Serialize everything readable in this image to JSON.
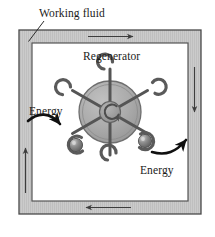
{
  "figure": {
    "title_labels": {
      "working_fluid": "Working fluid",
      "regenerator": "Regenerator",
      "energy_in": "Energy",
      "energy_out": "Energy"
    },
    "colors": {
      "duct_fill": "#c9c9c9",
      "duct_stripe": "#bdbdbd",
      "duct_border": "#4a4a4a",
      "chamber_fill": "#ffffff",
      "wheel_disc": "#a9a9a9",
      "wheel_disc_edge": "#6e6e6e",
      "spoke": "#5c5c5c",
      "hub": "#8f8f8f",
      "sphere": "#707070",
      "sphere_highlight": "#c4c4c4",
      "arrow_thin": "#3d3d3d",
      "arrow_thick": "#101010",
      "text": "#1a1a1a"
    },
    "duct": {
      "name": "working-fluid-duct",
      "outer": {
        "x": 19,
        "y": 30,
        "width": 182,
        "height": 184
      },
      "inner": {
        "x": 32,
        "y": 43,
        "width": 156,
        "height": 158
      }
    },
    "flow_arrows": [
      {
        "name": "flow-arrow-top",
        "direction": "right",
        "x1": 88,
        "y1": 36.5,
        "x2": 135,
        "y2": 36.5
      },
      {
        "name": "flow-arrow-right",
        "direction": "down",
        "x1": 194.5,
        "y1": 67,
        "x2": 194.5,
        "y2": 114
      },
      {
        "name": "flow-arrow-bottom",
        "direction": "left",
        "x1": 130,
        "y1": 207.5,
        "x2": 84,
        "y2": 207.5
      },
      {
        "name": "flow-arrow-left",
        "direction": "up",
        "x1": 25.5,
        "y1": 193,
        "x2": 25.5,
        "y2": 146
      }
    ],
    "leader_line": {
      "name": "working-fluid-leader",
      "x1": 44,
      "y1": 22,
      "x2": 28,
      "y2": 41
    },
    "regenerator_wheel": {
      "name": "regenerator-wheel",
      "center_x": 110,
      "center_y": 112,
      "disc_radius": 31,
      "hub_radius": 10,
      "spoke_count": 6,
      "spoke_angles_deg": [
        90,
        150,
        210,
        270,
        330,
        30
      ],
      "rotation_indicator": "clockwise-circular-arrow"
    },
    "energy_spheres": [
      {
        "name": "energy-sphere-inlet",
        "cx": 76,
        "cy": 145,
        "r": 6.5
      },
      {
        "name": "energy-sphere-outlet",
        "cx": 145,
        "cy": 141,
        "r": 6.5
      }
    ]
  }
}
